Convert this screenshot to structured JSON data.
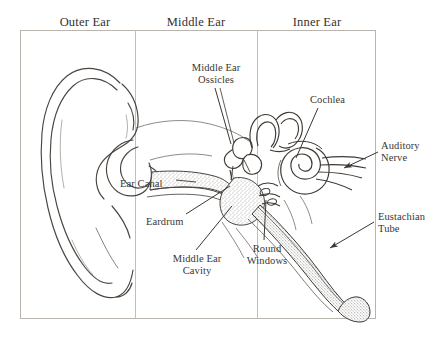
{
  "figure": {
    "background_color": "#ffffff",
    "ink_color": "#3a3632",
    "frame": {
      "x": 20,
      "y": 30,
      "width": 355,
      "height": 288,
      "divider_x": [
        135,
        257
      ]
    }
  },
  "headers": {
    "outer": "Outer Ear",
    "middle": "Middle Ear",
    "inner": "Inner Ear"
  },
  "labels": {
    "ossicles": "Middle Ear\nOssicles",
    "ossicles_line1": "Middle Ear",
    "ossicles_line2": "Ossicles",
    "cochlea": "Cochlea",
    "auditory_line1": "Auditory",
    "auditory_line2": "Nerve",
    "ear_canal": "Ear Canal",
    "eardrum": "Eardrum",
    "eustachian_line1": "Eustachian",
    "eustachian_line2": "Tube",
    "middle_ear_cavity_line1": "Middle Ear",
    "middle_ear_cavity_line2": "Cavity",
    "round_windows_line1": "Round",
    "round_windows_line2": "Windows"
  },
  "parts": [
    "pinna",
    "ear-canal",
    "eardrum",
    "middle-ear-ossicles",
    "middle-ear-cavity",
    "semicircular-canals",
    "cochlea",
    "auditory-nerve",
    "round-windows",
    "eustachian-tube"
  ]
}
